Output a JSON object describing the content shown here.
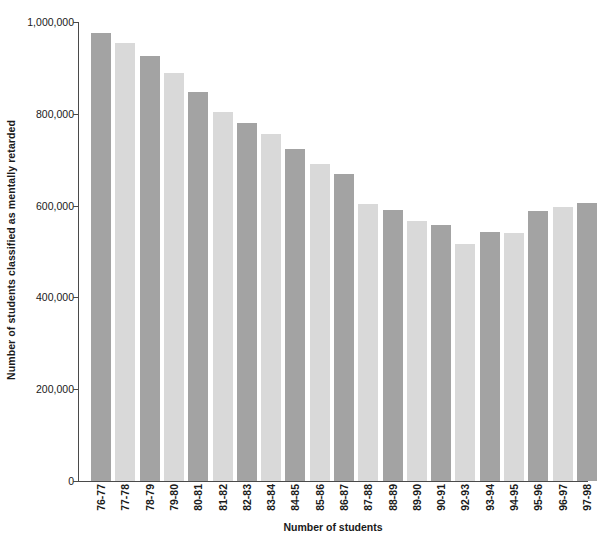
{
  "chart_data": {
    "type": "bar",
    "title": "",
    "xlabel": "Number of students",
    "ylabel": "Number of students classified as mentally retarded",
    "ylim": [
      0,
      1000000
    ],
    "grid": false,
    "legend": "none",
    "ytick_labels": [
      "0",
      "200,000",
      "400,000",
      "600,000",
      "800,000",
      "1,000,000"
    ],
    "ytick_values": [
      0,
      200000,
      400000,
      600000,
      800000,
      1000000
    ],
    "categories": [
      "76-77",
      "77-78",
      "78-79",
      "79-80",
      "80-81",
      "81-82",
      "82-83",
      "83-84",
      "84-85",
      "85-86",
      "86-87",
      "87-88",
      "88-89",
      "89-90",
      "90-91",
      "92-93",
      "93-94",
      "94-95",
      "95-96",
      "96-97",
      "97-98"
    ],
    "values": [
      977000,
      955000,
      925000,
      888000,
      848000,
      805000,
      780000,
      756000,
      724000,
      691000,
      669000,
      603000,
      590000,
      566000,
      558000,
      516000,
      542000,
      540000,
      588000,
      596000,
      605000
    ],
    "bar_colors": [
      "#a3a3a3",
      "#d9d9d9",
      "#a3a3a3",
      "#d9d9d9",
      "#a3a3a3",
      "#d9d9d9",
      "#a3a3a3",
      "#d9d9d9",
      "#a3a3a3",
      "#d9d9d9",
      "#a3a3a3",
      "#d9d9d9",
      "#a3a3a3",
      "#d9d9d9",
      "#a3a3a3",
      "#d9d9d9",
      "#a3a3a3",
      "#d9d9d9",
      "#a3a3a3",
      "#d9d9d9",
      "#a3a3a3"
    ],
    "colors": {
      "dark_bar": "#a3a3a3",
      "light_bar": "#d9d9d9",
      "axis": "#4a4a4a",
      "text": "#1a1a1a",
      "background": "#ffffff"
    }
  }
}
